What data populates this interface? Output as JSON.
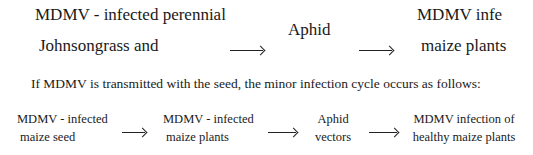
{
  "major_cycle": {
    "node1": {
      "line1": "MDMV - infected perennial",
      "line2": "Johnsongrass and"
    },
    "node2": {
      "line1": "Aphid"
    },
    "node3": {
      "line1": "MDMV infect",
      "line2": "maize plants"
    }
  },
  "intro_text": "If MDMV is transmitted with the seed, the minor infection cycle occurs as follows:",
  "minor_cycle": {
    "node1": {
      "line1": "MDMV - infected",
      "line2": "maize seed"
    },
    "node2": {
      "line1": "MDMV - infected",
      "line2": "maize plants"
    },
    "node3": {
      "line1": "Aphid",
      "line2": "vectors"
    },
    "node4": {
      "line1": "MDMV infection of",
      "line2": "healthy maize plants"
    }
  }
}
